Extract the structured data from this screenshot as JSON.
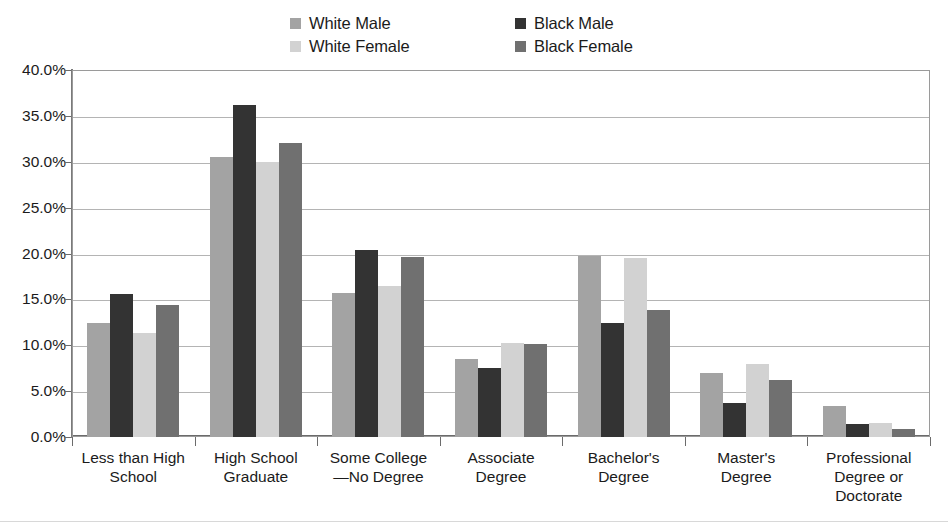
{
  "chart_data": {
    "type": "bar",
    "title": "",
    "subtitle": "",
    "xlabel": "",
    "ylabel": "",
    "ylim": [
      0,
      40
    ],
    "ytick_labels": [
      "40.0%",
      "35.0%",
      "30.0%",
      "25.0%",
      "20.0%",
      "15.0%",
      "10.0%",
      "5.0%",
      "0.0%"
    ],
    "ytick_values": [
      40,
      35,
      30,
      25,
      20,
      15,
      10,
      5,
      0
    ],
    "grid": true,
    "legend_position": "top-center",
    "categories": [
      "Less than High School",
      "High School Graduate",
      "Some College—No Degree",
      "Associate Degree",
      "Bachelor's Degree",
      "Master's Degree",
      "Professional Degree or Doctorate"
    ],
    "category_lines": [
      [
        "Less than High",
        "School"
      ],
      [
        "High School",
        "Graduate"
      ],
      [
        "Some College",
        "—No Degree"
      ],
      [
        "Associate",
        "Degree"
      ],
      [
        "Bachelor's",
        "Degree"
      ],
      [
        "Master's",
        "Degree"
      ],
      [
        "Professional",
        "Degree or",
        "Doctorate"
      ]
    ],
    "series": [
      {
        "name": "White Male",
        "color": "#a3a3a3",
        "values": [
          12.4,
          30.5,
          15.7,
          8.5,
          19.7,
          7.0,
          3.4
        ]
      },
      {
        "name": "Black Male",
        "color": "#333333",
        "values": [
          15.6,
          36.2,
          20.4,
          7.5,
          12.4,
          3.7,
          1.4
        ]
      },
      {
        "name": "White Female",
        "color": "#d2d2d2",
        "values": [
          11.3,
          30.0,
          16.5,
          10.2,
          19.5,
          8.0,
          1.5
        ]
      },
      {
        "name": "Black Female",
        "color": "#707070",
        "values": [
          14.4,
          32.0,
          19.6,
          10.1,
          13.8,
          6.2,
          0.9
        ]
      }
    ]
  },
  "legend": {
    "entries": [
      {
        "label": "White Male",
        "color": "#a3a3a3"
      },
      {
        "label": "Black Male",
        "color": "#333333"
      },
      {
        "label": "White Female",
        "color": "#d2d2d2"
      },
      {
        "label": "Black Female",
        "color": "#707070"
      }
    ]
  }
}
